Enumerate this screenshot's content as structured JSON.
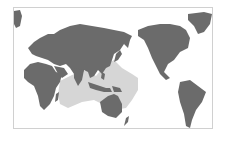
{
  "map": {
    "projection": "Pacific-centered world map",
    "colors": {
      "background": "#ffffff",
      "land": "#6b6b6b",
      "range": "#d6d6d6",
      "frame": "#d0d0d0"
    },
    "regions": [
      {
        "name": "Africa"
      },
      {
        "name": "Europe"
      },
      {
        "name": "Asia"
      },
      {
        "name": "Australia"
      },
      {
        "name": "North America"
      },
      {
        "name": "South America"
      },
      {
        "name": "Greenland"
      },
      {
        "name": "New Zealand"
      }
    ],
    "highlighted_range": "Indo-Pacific distribution (Indian Ocean to western Pacific)"
  }
}
